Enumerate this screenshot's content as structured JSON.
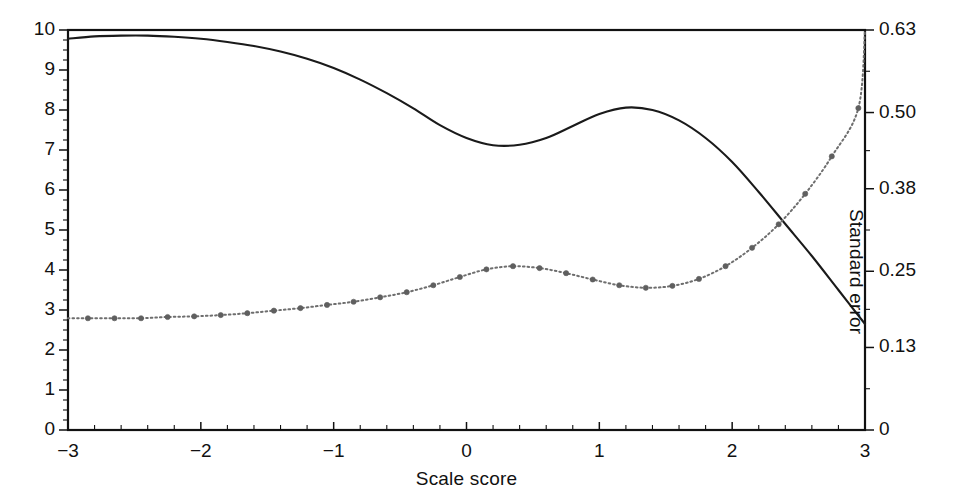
{
  "chart_data": {
    "type": "line",
    "title": "",
    "xlabel": "Scale score",
    "ylabel": "Information",
    "y2label": "Standard error",
    "xlim": [
      -3,
      3
    ],
    "ylim": [
      0,
      10
    ],
    "y2lim": [
      0,
      0.63
    ],
    "grid": false,
    "legend": "none",
    "xticks": [
      -3,
      -2,
      -1,
      0,
      1,
      2,
      3
    ],
    "xticklabels": [
      "−3",
      "−2",
      "−1",
      "0",
      "1",
      "2",
      "3"
    ],
    "x_minor_tick_step": 0.2,
    "yticks": [
      0,
      1,
      2,
      3,
      4,
      5,
      6,
      7,
      8,
      9,
      10
    ],
    "yticklabels": [
      "0",
      "1",
      "2",
      "3",
      "4",
      "5",
      "6",
      "7",
      "8",
      "9",
      "10"
    ],
    "y_minor_tick_step": 0.25,
    "y2ticks": [
      0,
      0.13,
      0.25,
      0.38,
      0.5,
      0.63
    ],
    "y2ticklabels": [
      "0",
      "0.13",
      "0.25",
      "0.38",
      "0.50",
      "0.63"
    ],
    "colors": {
      "information": "#1a1a1a",
      "standard_error": "#6e6e6e",
      "axis": "#111111",
      "background": "#ffffff"
    },
    "series": [
      {
        "name": "Information",
        "axis": "left",
        "style": "solid",
        "markers": false,
        "x": [
          -3.0,
          -2.8,
          -2.6,
          -2.4,
          -2.2,
          -2.0,
          -1.8,
          -1.6,
          -1.4,
          -1.2,
          -1.0,
          -0.8,
          -0.6,
          -0.4,
          -0.2,
          0.0,
          0.2,
          0.4,
          0.6,
          0.8,
          1.0,
          1.2,
          1.4,
          1.6,
          1.8,
          2.0,
          2.2,
          2.4,
          2.6,
          2.8,
          3.0
        ],
        "values": [
          9.78,
          9.84,
          9.86,
          9.86,
          9.83,
          9.78,
          9.7,
          9.6,
          9.46,
          9.28,
          9.05,
          8.76,
          8.42,
          8.04,
          7.62,
          7.3,
          7.12,
          7.13,
          7.3,
          7.6,
          7.9,
          8.06,
          8.0,
          7.74,
          7.3,
          6.7,
          5.95,
          5.15,
          4.35,
          3.5,
          2.65
        ]
      },
      {
        "name": "Standard error",
        "axis": "right",
        "style": "dotted",
        "markers": true,
        "x": [
          -2.85,
          -2.65,
          -2.45,
          -2.25,
          -2.05,
          -1.85,
          -1.65,
          -1.45,
          -1.25,
          -1.05,
          -0.85,
          -0.65,
          -0.45,
          -0.25,
          -0.05,
          0.15,
          0.35,
          0.55,
          0.75,
          0.95,
          1.15,
          1.35,
          1.55,
          1.75,
          1.95,
          2.15,
          2.35,
          2.55,
          2.75,
          2.95
        ],
        "values_left_axis_equivalent": [
          2.8,
          2.8,
          2.8,
          2.82,
          2.84,
          2.88,
          2.92,
          2.98,
          3.05,
          3.12,
          3.2,
          3.32,
          3.45,
          3.62,
          3.82,
          4.02,
          4.1,
          4.05,
          3.92,
          3.76,
          3.62,
          3.55,
          3.6,
          3.78,
          4.1,
          4.55,
          5.15,
          5.9,
          6.85,
          8.05
        ],
        "values": [
          0.176,
          0.176,
          0.176,
          0.178,
          0.179,
          0.181,
          0.184,
          0.188,
          0.192,
          0.197,
          0.202,
          0.209,
          0.217,
          0.228,
          0.241,
          0.253,
          0.258,
          0.255,
          0.247,
          0.237,
          0.228,
          0.224,
          0.227,
          0.238,
          0.258,
          0.287,
          0.324,
          0.372,
          0.431,
          0.507
        ],
        "endpoint_note": "curve continues to 0.63 at x = 3"
      }
    ]
  },
  "axes": {
    "x_title": "Scale score",
    "y_left_title": "Information",
    "y_right_title": "Standard error"
  }
}
